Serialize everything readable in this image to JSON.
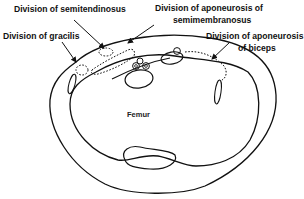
{
  "diagram": {
    "labels": {
      "semitendinosus": "Division of semitendinosus",
      "gracilis": "Division of gracilis",
      "semimembranosus_line1": "Division of aponeurosis of",
      "semimembranosus_line2": "semimembranosus",
      "biceps_line1": "Division of aponeurosis",
      "biceps_line2": "of biceps",
      "femur": "Femur"
    },
    "colors": {
      "stroke": "#111111",
      "background": "#ffffff"
    }
  }
}
